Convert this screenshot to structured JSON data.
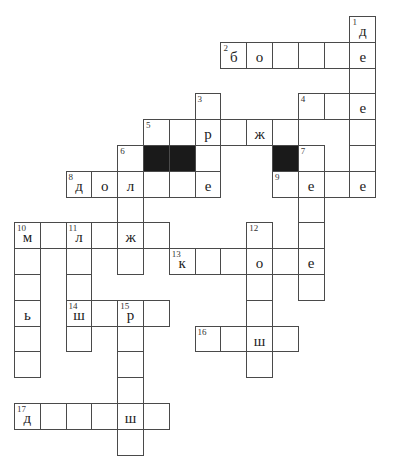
{
  "puzzle": {
    "type": "crossword",
    "origin": {
      "x": 14,
      "y": 16
    },
    "cell_size": 25.8,
    "cols": 14,
    "rows": 17,
    "colors": {
      "border": "#4a4a4a",
      "fill": "#ffffff",
      "blocked": "#1a1a1a",
      "text": "#222222"
    },
    "cells": [
      {
        "r": 0,
        "c": 13,
        "n": "1",
        "l": "д"
      },
      {
        "r": 1,
        "c": 8,
        "n": "2",
        "l": "б"
      },
      {
        "r": 1,
        "c": 9,
        "l": "о"
      },
      {
        "r": 1,
        "c": 10
      },
      {
        "r": 1,
        "c": 11
      },
      {
        "r": 1,
        "c": 12
      },
      {
        "r": 1,
        "c": 13,
        "l": "е"
      },
      {
        "r": 2,
        "c": 13
      },
      {
        "r": 3,
        "c": 7,
        "n": "3"
      },
      {
        "r": 3,
        "c": 11,
        "n": "4"
      },
      {
        "r": 3,
        "c": 12
      },
      {
        "r": 3,
        "c": 13,
        "l": "е"
      },
      {
        "r": 4,
        "c": 5,
        "n": "5"
      },
      {
        "r": 4,
        "c": 6
      },
      {
        "r": 4,
        "c": 7,
        "l": "р"
      },
      {
        "r": 4,
        "c": 8
      },
      {
        "r": 4,
        "c": 9,
        "l": "ж"
      },
      {
        "r": 4,
        "c": 10
      },
      {
        "r": 4,
        "c": 13
      },
      {
        "r": 5,
        "c": 4,
        "n": "6"
      },
      {
        "r": 5,
        "c": 5,
        "black": true
      },
      {
        "r": 5,
        "c": 6,
        "black": true
      },
      {
        "r": 5,
        "c": 7
      },
      {
        "r": 5,
        "c": 10,
        "black": true
      },
      {
        "r": 5,
        "c": 11,
        "n": "7"
      },
      {
        "r": 5,
        "c": 13
      },
      {
        "r": 6,
        "c": 2,
        "n": "8",
        "l": "д"
      },
      {
        "r": 6,
        "c": 3,
        "l": "о"
      },
      {
        "r": 6,
        "c": 4,
        "l": "л"
      },
      {
        "r": 6,
        "c": 5
      },
      {
        "r": 6,
        "c": 6
      },
      {
        "r": 6,
        "c": 7,
        "l": "е"
      },
      {
        "r": 6,
        "c": 10,
        "n": "9"
      },
      {
        "r": 6,
        "c": 11,
        "l": "е"
      },
      {
        "r": 6,
        "c": 12
      },
      {
        "r": 6,
        "c": 13,
        "l": "е"
      },
      {
        "r": 7,
        "c": 4
      },
      {
        "r": 7,
        "c": 11
      },
      {
        "r": 8,
        "c": 0,
        "n": "10",
        "l": "м"
      },
      {
        "r": 8,
        "c": 1
      },
      {
        "r": 8,
        "c": 2,
        "n": "11",
        "l": "л"
      },
      {
        "r": 8,
        "c": 3
      },
      {
        "r": 8,
        "c": 4,
        "l": "ж"
      },
      {
        "r": 8,
        "c": 5
      },
      {
        "r": 8,
        "c": 9,
        "n": "12"
      },
      {
        "r": 8,
        "c": 11
      },
      {
        "r": 9,
        "c": 0
      },
      {
        "r": 9,
        "c": 2
      },
      {
        "r": 9,
        "c": 4
      },
      {
        "r": 9,
        "c": 6,
        "n": "13",
        "l": "к"
      },
      {
        "r": 9,
        "c": 7
      },
      {
        "r": 9,
        "c": 8
      },
      {
        "r": 9,
        "c": 9,
        "l": "о"
      },
      {
        "r": 9,
        "c": 10
      },
      {
        "r": 9,
        "c": 11,
        "l": "е"
      },
      {
        "r": 10,
        "c": 0
      },
      {
        "r": 10,
        "c": 2
      },
      {
        "r": 10,
        "c": 9
      },
      {
        "r": 10,
        "c": 11
      },
      {
        "r": 11,
        "c": 0,
        "l": "ь"
      },
      {
        "r": 11,
        "c": 2,
        "n": "14",
        "l": "ш"
      },
      {
        "r": 11,
        "c": 3
      },
      {
        "r": 11,
        "c": 4,
        "n": "15",
        "l": "р"
      },
      {
        "r": 11,
        "c": 5
      },
      {
        "r": 11,
        "c": 9
      },
      {
        "r": 12,
        "c": 0
      },
      {
        "r": 12,
        "c": 2
      },
      {
        "r": 12,
        "c": 4
      },
      {
        "r": 12,
        "c": 7,
        "n": "16"
      },
      {
        "r": 12,
        "c": 8
      },
      {
        "r": 12,
        "c": 9,
        "l": "ш"
      },
      {
        "r": 12,
        "c": 10
      },
      {
        "r": 13,
        "c": 0
      },
      {
        "r": 13,
        "c": 4
      },
      {
        "r": 13,
        "c": 9
      },
      {
        "r": 14,
        "c": 4
      },
      {
        "r": 15,
        "c": 0,
        "n": "17",
        "l": "д"
      },
      {
        "r": 15,
        "c": 1
      },
      {
        "r": 15,
        "c": 2
      },
      {
        "r": 15,
        "c": 3
      },
      {
        "r": 15,
        "c": 4,
        "l": "ш"
      },
      {
        "r": 15,
        "c": 5
      },
      {
        "r": 16,
        "c": 4
      }
    ]
  }
}
